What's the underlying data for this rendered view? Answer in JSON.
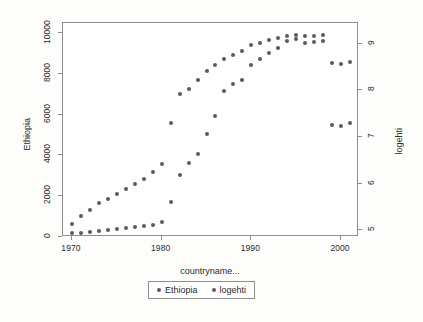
{
  "chart_data": {
    "type": "scatter",
    "title": "",
    "xlabel": "countryname...",
    "ylabel": "Ethiopia",
    "ylabel_right": "logehti",
    "xlim": [
      1969,
      2002
    ],
    "ylim": [
      0,
      10500
    ],
    "ylim_right": [
      4.85,
      9.45
    ],
    "xticks": [
      1970,
      1980,
      1990,
      2000
    ],
    "yticks": [
      0,
      2000,
      4000,
      6000,
      8000,
      10000
    ],
    "yticks_right": [
      5,
      6,
      7,
      8,
      9
    ],
    "grid": false,
    "legend_position": "bottom",
    "marker_color": "#5a5a5f",
    "frame_color": "#8e8e8e",
    "background": "#ffffff",
    "series": [
      {
        "name": "Ethiopia",
        "axis": "left",
        "x": [
          1970,
          1971,
          1972,
          1973,
          1974,
          1975,
          1976,
          1977,
          1978,
          1979,
          1980,
          1981,
          1982,
          1983,
          1984,
          1985,
          1986,
          1987,
          1988,
          1989,
          1990,
          1991,
          1992,
          1993,
          1994,
          1995,
          1996,
          1997,
          1998,
          1999,
          2000,
          2001
        ],
        "y": [
          180,
          200,
          250,
          300,
          330,
          380,
          430,
          480,
          520,
          600,
          740,
          1700,
          3050,
          3650,
          4050,
          5050,
          5950,
          7150,
          7500,
          7700,
          8450,
          8750,
          9050,
          9250,
          9600,
          9700,
          9500,
          9550,
          9600,
          8550,
          8500,
          8600
        ]
      },
      {
        "name": "logehti",
        "axis": "right",
        "x": [
          1970,
          1971,
          1972,
          1973,
          1974,
          1975,
          1976,
          1977,
          1978,
          1979,
          1980,
          1981,
          1982,
          1983,
          1984,
          1985,
          1986,
          1987,
          1988,
          1989,
          1990,
          1991,
          1992,
          1993,
          1994,
          1995,
          1996,
          1997,
          1998,
          1999,
          2000,
          2001
        ],
        "y": [
          5.12,
          5.31,
          5.44,
          5.58,
          5.67,
          5.78,
          5.88,
          6.0,
          6.1,
          6.24,
          6.42,
          7.3,
          7.93,
          8.04,
          8.23,
          8.41,
          8.55,
          8.68,
          8.77,
          8.84,
          8.98,
          9.02,
          9.08,
          9.12,
          9.17,
          9.19,
          9.18,
          9.18,
          9.19,
          7.25,
          7.23,
          7.31
        ]
      }
    ]
  },
  "legend": {
    "items": [
      {
        "label": "Ethiopia"
      },
      {
        "label": "logehti"
      }
    ]
  }
}
